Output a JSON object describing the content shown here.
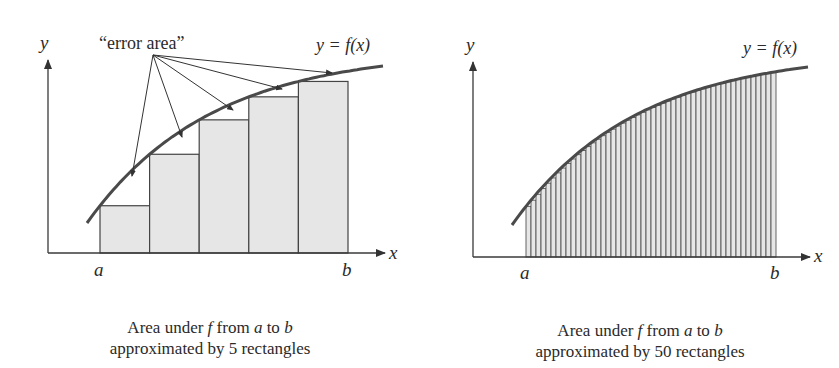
{
  "left_panel": {
    "y_axis_label": "y",
    "x_axis_label": "x",
    "a_label": "a",
    "b_label": "b",
    "curve_label": "y = f(x)",
    "annotation": "“error area”",
    "caption_line1_pre": "Area under ",
    "caption_f": "f",
    "caption_mid": " from ",
    "caption_a": "a",
    "caption_to": " to ",
    "caption_b": "b",
    "caption_line2": "approximated by 5 rectangles"
  },
  "right_panel": {
    "y_axis_label": "y",
    "x_axis_label": "x",
    "a_label": "a",
    "b_label": "b",
    "curve_label": "y = f(x)",
    "caption_line1_pre": "Area under ",
    "caption_f": "f",
    "caption_mid": " from ",
    "caption_a": "a",
    "caption_to": " to ",
    "caption_b": "b",
    "caption_line2": "approximated by 50 rectangles"
  },
  "colors": {
    "rect_fill": "#e6e6e6",
    "line": "#3a3a3a",
    "curve": "#4a4a4a"
  },
  "chart_data": [
    {
      "type": "area",
      "title": "Area under f from a to b approximated by 5 rectangles",
      "xlabel": "x",
      "ylabel": "y",
      "rectangles": 5,
      "rect_heights_relative": [
        0.26,
        0.51,
        0.67,
        0.78,
        0.85
      ],
      "annotation": "error area",
      "curve": "y = f(x)",
      "x_ticks": [
        "a",
        "b"
      ]
    },
    {
      "type": "area",
      "title": "Area under f from a to b approximated by 50 rectangles",
      "xlabel": "x",
      "ylabel": "y",
      "rectangles": 50,
      "curve": "y = f(x)",
      "x_ticks": [
        "a",
        "b"
      ]
    }
  ]
}
